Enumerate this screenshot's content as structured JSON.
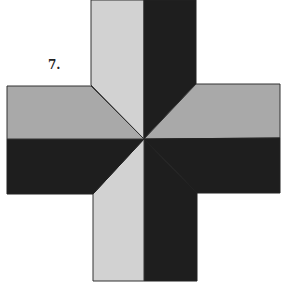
{
  "figure": {
    "label": "7.",
    "colors": {
      "light": "#d2d2d2",
      "medium": "#a9a9a9",
      "dark": "#1e1e1e",
      "outline": "#333333",
      "background": "#ffffff"
    }
  }
}
